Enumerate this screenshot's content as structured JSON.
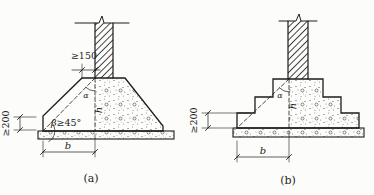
{
  "figure": {
    "background_color": "#fcfcfa",
    "line_color": "#1c1c1c",
    "diagrams": {
      "a": {
        "caption": "(a)",
        "labels": {
          "top_ledge_min": "≥150",
          "edge_height_min": "≥200",
          "beta_symbol": "β",
          "beta_min": "≥45°",
          "alpha_symbol": "α",
          "footing_height": "h",
          "ledge_width": "b"
        }
      },
      "b": {
        "caption": "(b)",
        "labels": {
          "edge_height_min": "≥200",
          "alpha_symbol": "α",
          "footing_height": "h",
          "ledge_width": "b"
        }
      }
    }
  }
}
